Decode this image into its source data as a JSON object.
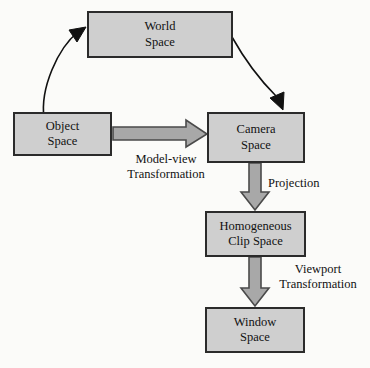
{
  "diagram": {
    "colors": {
      "box_fill": "#cfcfcf",
      "box_border": "#2b2b2b",
      "arrow_fill": "#a8a8a8",
      "arrow_border": "#4a4a4a",
      "thin_arrow": "#111111",
      "text": "#111111",
      "background": "#fbfbf9"
    },
    "nodes": [
      {
        "id": "world",
        "label": "World\nSpace",
        "x": 87,
        "y": 11,
        "w": 146,
        "h": 47
      },
      {
        "id": "object",
        "label": "Object\nSpace",
        "x": 13,
        "y": 112,
        "w": 99,
        "h": 44
      },
      {
        "id": "camera",
        "label": "Camera\nSpace",
        "x": 207,
        "y": 112,
        "w": 98,
        "h": 51
      },
      {
        "id": "clip",
        "label": "Homogeneous\nClip Space",
        "x": 205,
        "y": 211,
        "w": 101,
        "h": 46
      },
      {
        "id": "window",
        "label": "Window\nSpace",
        "x": 205,
        "y": 307,
        "w": 100,
        "h": 46
      }
    ],
    "edge_labels": [
      {
        "id": "modelview",
        "text": "Model-view\nTransformation",
        "x": 114,
        "y": 152,
        "w": 104
      },
      {
        "id": "projection",
        "text": "Projection",
        "x": 268,
        "y": 176,
        "w": 80
      },
      {
        "id": "viewport",
        "text": "Viewport\nTransformation",
        "x": 266,
        "y": 262,
        "w": 104
      }
    ],
    "edges": [
      {
        "id": "object-to-world",
        "from": "object",
        "to": "world",
        "style": "thin-curve",
        "label": ""
      },
      {
        "id": "world-to-camera",
        "from": "world",
        "to": "camera",
        "style": "thin-curve",
        "label": ""
      },
      {
        "id": "object-to-camera",
        "from": "object",
        "to": "camera",
        "style": "block-arrow",
        "label": "Model-view\nTransformation"
      },
      {
        "id": "camera-to-clip",
        "from": "camera",
        "to": "clip",
        "style": "block-arrow",
        "label": "Projection"
      },
      {
        "id": "clip-to-window",
        "from": "clip",
        "to": "window",
        "style": "block-arrow",
        "label": "Viewport\nTransformation"
      }
    ]
  }
}
